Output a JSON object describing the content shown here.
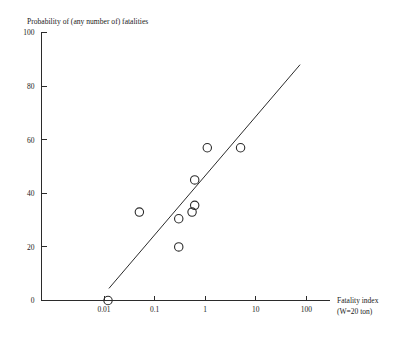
{
  "chart_data": {
    "type": "scatter",
    "title": "Probability of (any number of) fatalities",
    "xlabel": "Fatality index",
    "xlabel_line2": "(W=20 ton)",
    "ylabel": "",
    "xscale": "log",
    "yscale": "linear",
    "xlim": [
      0.0022,
      220
    ],
    "ylim": [
      0,
      100
    ],
    "grid": false,
    "legend": null,
    "xticks": [
      0.01,
      0.1,
      1,
      10,
      100
    ],
    "xtick_labels": [
      "0.01",
      "0.1",
      "1",
      "10",
      "100"
    ],
    "yticks": [
      0,
      20,
      40,
      60,
      80,
      100
    ],
    "ytick_labels": [
      "0",
      "20",
      "40",
      "60",
      "80",
      "100"
    ],
    "series": [
      {
        "name": "observations",
        "marker": "open-circle",
        "points": [
          {
            "x": 0.012,
            "y": 0
          },
          {
            "x": 0.05,
            "y": 33
          },
          {
            "x": 0.3,
            "y": 20
          },
          {
            "x": 0.3,
            "y": 30.5
          },
          {
            "x": 0.55,
            "y": 33
          },
          {
            "x": 0.62,
            "y": 35.5
          },
          {
            "x": 0.62,
            "y": 45
          },
          {
            "x": 1.1,
            "y": 57
          },
          {
            "x": 5.0,
            "y": 57
          }
        ]
      },
      {
        "name": "fitted-line",
        "marker": "line",
        "points": [
          {
            "x": 0.0125,
            "y": 4.5
          },
          {
            "x": 75,
            "y": 88
          }
        ]
      }
    ]
  },
  "colors": {
    "ink": "#2b2b2b",
    "background": "#ffffff"
  }
}
